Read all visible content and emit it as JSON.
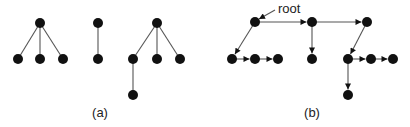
{
  "colors": {
    "node": "#111111",
    "edge": "#555555",
    "text": "#222222",
    "background": "#ffffff"
  },
  "panels": [
    {
      "id": "a",
      "caption": "(a)",
      "caption_pos": [
        100,
        117
      ],
      "directed": false,
      "nodes": [
        {
          "id": "a1",
          "x": 40,
          "y": 23
        },
        {
          "id": "a2",
          "x": 18,
          "y": 59
        },
        {
          "id": "a3",
          "x": 40,
          "y": 59
        },
        {
          "id": "a4",
          "x": 63,
          "y": 59
        },
        {
          "id": "b1",
          "x": 98,
          "y": 23
        },
        {
          "id": "b2",
          "x": 98,
          "y": 59
        },
        {
          "id": "c1",
          "x": 157,
          "y": 23
        },
        {
          "id": "c2",
          "x": 133,
          "y": 59
        },
        {
          "id": "c3",
          "x": 157,
          "y": 59
        },
        {
          "id": "c4",
          "x": 180,
          "y": 59
        },
        {
          "id": "c5",
          "x": 133,
          "y": 95
        }
      ],
      "edges": [
        [
          "a1",
          "a2"
        ],
        [
          "a1",
          "a3"
        ],
        [
          "a1",
          "a4"
        ],
        [
          "b1",
          "b2"
        ],
        [
          "c1",
          "c2"
        ],
        [
          "c1",
          "c3"
        ],
        [
          "c1",
          "c4"
        ],
        [
          "c2",
          "c5"
        ]
      ]
    },
    {
      "id": "b",
      "caption": "(b)",
      "caption_pos": [
        312,
        117
      ],
      "directed": true,
      "root_label": "root",
      "root_label_pos": [
        278,
        13
      ],
      "root_pointer": [
        [
          275,
          10
        ],
        [
          259,
          19
        ]
      ],
      "nodes": [
        {
          "id": "r",
          "x": 255,
          "y": 22
        },
        {
          "id": "m",
          "x": 312,
          "y": 22
        },
        {
          "id": "n",
          "x": 367,
          "y": 22
        },
        {
          "id": "p1",
          "x": 232,
          "y": 59
        },
        {
          "id": "p2",
          "x": 255,
          "y": 59
        },
        {
          "id": "p3",
          "x": 278,
          "y": 59
        },
        {
          "id": "q1",
          "x": 312,
          "y": 59
        },
        {
          "id": "s1",
          "x": 348,
          "y": 59
        },
        {
          "id": "s2",
          "x": 371,
          "y": 59
        },
        {
          "id": "s3",
          "x": 393,
          "y": 59
        },
        {
          "id": "t1",
          "x": 348,
          "y": 95
        }
      ],
      "edges": [
        [
          "r",
          "m"
        ],
        [
          "m",
          "n"
        ],
        [
          "r",
          "p1"
        ],
        [
          "p1",
          "p2"
        ],
        [
          "p2",
          "p3"
        ],
        [
          "m",
          "q1"
        ],
        [
          "n",
          "s1"
        ],
        [
          "s1",
          "s2"
        ],
        [
          "s2",
          "s3"
        ],
        [
          "s1",
          "t1"
        ]
      ]
    }
  ]
}
